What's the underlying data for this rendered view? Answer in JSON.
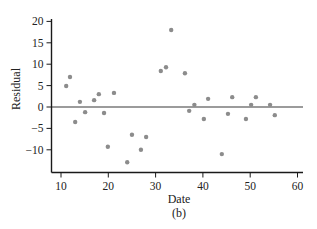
{
  "chart_data": {
    "type": "scatter",
    "title": "",
    "caption": "(b)",
    "xlabel": "Date",
    "ylabel": "Residual",
    "xlim": [
      8,
      61
    ],
    "ylim": [
      -15,
      21
    ],
    "x_ticks": [
      10,
      20,
      30,
      40,
      50,
      60
    ],
    "y_ticks": [
      -10,
      -5,
      0,
      5,
      10,
      15,
      20
    ],
    "x_tick_labels": [
      "10",
      "20",
      "30",
      "40",
      "50",
      "60"
    ],
    "y_tick_labels": [
      "−10",
      "−5",
      "0",
      "5",
      "10",
      "15",
      "20"
    ],
    "grid": false,
    "legend": null,
    "reference_line": {
      "y": 0,
      "label": "zero residual line"
    },
    "series": [
      {
        "name": "Residuals",
        "color": "#8c8c8c",
        "points": [
          {
            "x": 11.1,
            "y": 4.9
          },
          {
            "x": 11.9,
            "y": 7.0
          },
          {
            "x": 13.0,
            "y": -3.5
          },
          {
            "x": 14.0,
            "y": 1.2
          },
          {
            "x": 15.1,
            "y": -1.2
          },
          {
            "x": 17.0,
            "y": 1.6
          },
          {
            "x": 18.0,
            "y": 3.0
          },
          {
            "x": 19.1,
            "y": -1.4
          },
          {
            "x": 19.9,
            "y": -9.3
          },
          {
            "x": 21.2,
            "y": 3.3
          },
          {
            "x": 24.0,
            "y": -12.9
          },
          {
            "x": 25.0,
            "y": -6.5
          },
          {
            "x": 26.9,
            "y": -10.0
          },
          {
            "x": 28.0,
            "y": -7.0
          },
          {
            "x": 31.1,
            "y": 8.4
          },
          {
            "x": 32.2,
            "y": 9.3
          },
          {
            "x": 33.3,
            "y": 18.0
          },
          {
            "x": 36.2,
            "y": 7.9
          },
          {
            "x": 37.1,
            "y": -0.9
          },
          {
            "x": 38.2,
            "y": 0.5
          },
          {
            "x": 40.2,
            "y": -2.8
          },
          {
            "x": 41.1,
            "y": 1.9
          },
          {
            "x": 44.0,
            "y": -11.0
          },
          {
            "x": 45.3,
            "y": -1.6
          },
          {
            "x": 46.2,
            "y": 2.3
          },
          {
            "x": 49.1,
            "y": -2.8
          },
          {
            "x": 50.2,
            "y": 0.5
          },
          {
            "x": 51.2,
            "y": 2.3
          },
          {
            "x": 54.2,
            "y": 0.5
          },
          {
            "x": 55.2,
            "y": -1.9
          }
        ]
      }
    ]
  },
  "colors": {
    "axis": "#1a1a1a",
    "zero_line": "#7a7a7a",
    "point": "#8c8c8c",
    "text": "#222222"
  }
}
